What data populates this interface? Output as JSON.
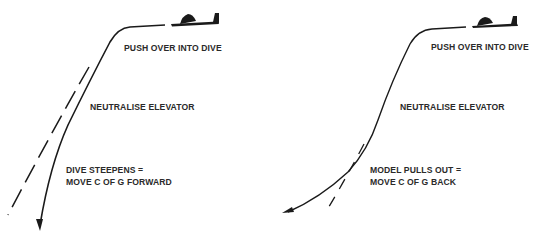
{
  "diagram": {
    "type": "flight-trim-diagram",
    "panels": [
      {
        "id": "left",
        "labels": {
          "push_over": "PUSH OVER INTO DIVE",
          "neutralise": "NEUTRALISE ELEVATOR",
          "result_line1": "DIVE STEEPENS =",
          "result_line2": "MOVE C OF G FORWARD"
        },
        "icons": [
          "aircraft-icon",
          "flight-path-arrow-icon",
          "dashed-reference-path-icon"
        ]
      },
      {
        "id": "right",
        "labels": {
          "push_over": "PUSH OVER INTO DIVE",
          "neutralise": "NEUTRALISE ELEVATOR",
          "result_line1": "MODEL PULLS OUT =",
          "result_line2": "MOVE C OF G BACK"
        },
        "icons": [
          "aircraft-icon",
          "flight-path-arrow-icon",
          "dashed-reference-path-icon"
        ]
      }
    ],
    "colors": {
      "ink": "#1a1a1a",
      "background": "#ffffff"
    }
  }
}
